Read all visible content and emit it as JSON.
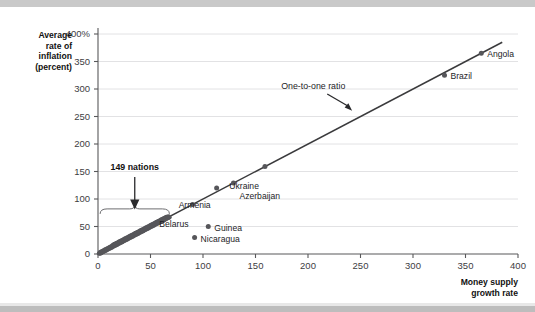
{
  "figure": {
    "background_color": "#ffffff",
    "band_color": "#c9c9c9"
  },
  "chart_data": {
    "type": "scatter",
    "title": "",
    "xlabel": "Money supply growth rate",
    "ylabel": "Average rate of inflation (percent)",
    "ylabel_lines": [
      "Average",
      "rate of",
      "inflation",
      "(percent)"
    ],
    "xlabel_lines": [
      "Money supply",
      "growth rate"
    ],
    "xlim": [
      0,
      400
    ],
    "ylim": [
      0,
      400
    ],
    "xticks": [
      0,
      50,
      100,
      150,
      200,
      250,
      300,
      350,
      400
    ],
    "xticklabels": [
      "0",
      "50",
      "100",
      "150",
      "200",
      "250",
      "300",
      "350",
      "400"
    ],
    "yticks": [
      0,
      50,
      100,
      150,
      200,
      250,
      300,
      350,
      400
    ],
    "yticklabels": [
      "0",
      "50",
      "100",
      "150",
      "200",
      "250",
      "300",
      "350",
      "400%"
    ],
    "grid": "horizontal",
    "legend": "none",
    "marker_color": "#56565a",
    "line_color": "#3a3a3c",
    "reference_line": {
      "label": "One-to-one ratio",
      "slope": 1,
      "intercept": 0,
      "x_start": 0,
      "x_end": 385,
      "annotation_x": 205,
      "annotation_y": 300,
      "arrow_to_x": 243,
      "arrow_to_y": 255
    },
    "bracket_annotation": {
      "label": "149 nations",
      "x_start": 2,
      "x_end": 68,
      "y": 82,
      "arrow_from_y": 140,
      "arrow_to_y": 92,
      "arrow_x": 35,
      "label_x": 35,
      "label_y": 152
    },
    "labeled_points": [
      {
        "name": "Belarus",
        "x": 90,
        "y": 90,
        "label_dx": -4,
        "label_dy": 22,
        "anchor": "end"
      },
      {
        "name": "Armenia",
        "x": 113,
        "y": 120,
        "label_dx": -6,
        "label_dy": 20,
        "anchor": "end"
      },
      {
        "name": "Azerbaijan",
        "x": 129,
        "y": 129,
        "label_dx": 6,
        "label_dy": 16,
        "anchor": "start"
      },
      {
        "name": "Ukraine",
        "x": 159,
        "y": 159,
        "label_dx": -6,
        "label_dy": 22,
        "anchor": "end"
      },
      {
        "name": "Brazil",
        "x": 330,
        "y": 325,
        "label_dx": 6,
        "label_dy": 4,
        "anchor": "start"
      },
      {
        "name": "Angola",
        "x": 365,
        "y": 365,
        "label_dx": 6,
        "label_dy": 4,
        "anchor": "start"
      },
      {
        "name": "Guinea",
        "x": 105,
        "y": 50,
        "label_dx": 6,
        "label_dy": 4,
        "anchor": "start"
      },
      {
        "name": "Nicaragua",
        "x": 92,
        "y": 30,
        "label_dx": 6,
        "label_dy": 4,
        "anchor": "start"
      }
    ],
    "cluster_description": "149 nations clustered along the one-to-one line between 0 and about 68 on both axes",
    "cluster_points": [
      [
        1,
        1
      ],
      [
        2,
        1
      ],
      [
        2,
        3
      ],
      [
        3,
        2
      ],
      [
        3,
        4
      ],
      [
        4,
        3
      ],
      [
        4,
        5
      ],
      [
        5,
        4
      ],
      [
        5,
        6
      ],
      [
        6,
        5
      ],
      [
        6,
        7
      ],
      [
        7,
        6
      ],
      [
        7,
        8
      ],
      [
        8,
        7
      ],
      [
        8,
        9
      ],
      [
        9,
        8
      ],
      [
        9,
        10
      ],
      [
        10,
        9
      ],
      [
        10,
        11
      ],
      [
        11,
        10
      ],
      [
        11,
        12
      ],
      [
        12,
        11
      ],
      [
        12,
        13
      ],
      [
        13,
        12
      ],
      [
        13,
        14
      ],
      [
        14,
        13
      ],
      [
        14,
        16
      ],
      [
        15,
        14
      ],
      [
        15,
        17
      ],
      [
        16,
        15
      ],
      [
        16,
        18
      ],
      [
        17,
        16
      ],
      [
        17,
        19
      ],
      [
        18,
        17
      ],
      [
        18,
        20
      ],
      [
        19,
        18
      ],
      [
        19,
        21
      ],
      [
        20,
        19
      ],
      [
        20,
        22
      ],
      [
        21,
        20
      ],
      [
        21,
        23
      ],
      [
        22,
        21
      ],
      [
        22,
        24
      ],
      [
        23,
        22
      ],
      [
        23,
        25
      ],
      [
        24,
        23
      ],
      [
        24,
        26
      ],
      [
        25,
        24
      ],
      [
        25,
        27
      ],
      [
        26,
        25
      ],
      [
        26,
        28
      ],
      [
        27,
        26
      ],
      [
        27,
        29
      ],
      [
        28,
        27
      ],
      [
        28,
        30
      ],
      [
        29,
        28
      ],
      [
        29,
        31
      ],
      [
        30,
        29
      ],
      [
        30,
        32
      ],
      [
        31,
        30
      ],
      [
        31,
        33
      ],
      [
        32,
        31
      ],
      [
        32,
        34
      ],
      [
        33,
        32
      ],
      [
        33,
        35
      ],
      [
        34,
        33
      ],
      [
        34,
        36
      ],
      [
        35,
        34
      ],
      [
        35,
        37
      ],
      [
        36,
        35
      ],
      [
        36,
        38
      ],
      [
        37,
        36
      ],
      [
        37,
        39
      ],
      [
        38,
        37
      ],
      [
        38,
        40
      ],
      [
        39,
        38
      ],
      [
        39,
        41
      ],
      [
        40,
        39
      ],
      [
        40,
        42
      ],
      [
        41,
        40
      ],
      [
        41,
        43
      ],
      [
        42,
        41
      ],
      [
        42,
        44
      ],
      [
        43,
        42
      ],
      [
        43,
        45
      ],
      [
        44,
        43
      ],
      [
        44,
        46
      ],
      [
        45,
        44
      ],
      [
        45,
        47
      ],
      [
        46,
        45
      ],
      [
        46,
        48
      ],
      [
        47,
        46
      ],
      [
        47,
        49
      ],
      [
        48,
        47
      ],
      [
        48,
        50
      ],
      [
        49,
        48
      ],
      [
        49,
        51
      ],
      [
        50,
        49
      ],
      [
        50,
        52
      ],
      [
        51,
        50
      ],
      [
        51,
        53
      ],
      [
        52,
        51
      ],
      [
        52,
        54
      ],
      [
        53,
        52
      ],
      [
        53,
        55
      ],
      [
        54,
        53
      ],
      [
        54,
        56
      ],
      [
        55,
        54
      ],
      [
        55,
        57
      ],
      [
        56,
        55
      ],
      [
        56,
        58
      ],
      [
        57,
        56
      ],
      [
        57,
        59
      ],
      [
        58,
        57
      ],
      [
        58,
        60
      ],
      [
        59,
        58
      ],
      [
        59,
        61
      ],
      [
        60,
        59
      ],
      [
        60,
        62
      ],
      [
        61,
        60
      ],
      [
        61,
        63
      ],
      [
        62,
        61
      ],
      [
        62,
        64
      ],
      [
        63,
        62
      ],
      [
        63,
        65
      ],
      [
        64,
        63
      ],
      [
        64,
        66
      ],
      [
        65,
        64
      ],
      [
        65,
        67
      ],
      [
        66,
        65
      ],
      [
        2,
        2
      ],
      [
        4,
        4
      ],
      [
        6,
        6
      ],
      [
        8,
        8
      ],
      [
        10,
        10
      ],
      [
        12,
        12
      ],
      [
        14,
        15
      ],
      [
        16,
        17
      ],
      [
        18,
        19
      ],
      [
        20,
        21
      ],
      [
        22,
        23
      ],
      [
        24,
        25
      ],
      [
        26,
        27
      ],
      [
        28,
        29
      ],
      [
        30,
        31
      ],
      [
        33,
        34
      ],
      [
        36,
        37
      ],
      [
        39,
        40
      ],
      [
        42,
        43
      ],
      [
        45,
        46
      ],
      [
        48,
        49
      ],
      [
        51,
        52
      ],
      [
        54,
        55
      ],
      [
        57,
        58
      ],
      [
        60,
        61
      ],
      [
        63,
        64
      ],
      [
        66,
        67
      ],
      [
        67,
        66
      ],
      [
        68,
        67
      ],
      [
        67,
        68
      ]
    ]
  }
}
